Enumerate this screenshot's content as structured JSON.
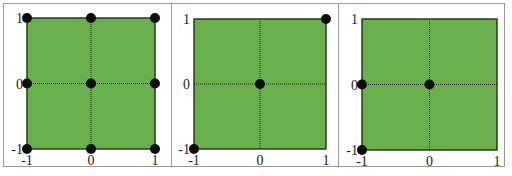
{
  "figure": {
    "background": "#ffffff",
    "plot_fill": "#6ab04c",
    "plot_border": "#2b3a22",
    "grid_line": "#1f2a18",
    "point_color": "#0d0d0d",
    "panel_border": "#9a9a9a"
  },
  "chart_data": [
    {
      "type": "scatter",
      "title": "",
      "xlabel": "",
      "ylabel": "",
      "xlim": [
        -1,
        1
      ],
      "ylim": [
        -1,
        1
      ],
      "xticks": [
        "-1",
        "0",
        "1"
      ],
      "yticks": [
        "-1",
        "0",
        "1"
      ],
      "grid": "dotted lines at x=0 and y=0",
      "points": [
        [
          -1,
          1
        ],
        [
          0,
          1
        ],
        [
          1,
          1
        ],
        [
          -1,
          0
        ],
        [
          0,
          0
        ],
        [
          1,
          0
        ],
        [
          -1,
          -1
        ],
        [
          0,
          -1
        ],
        [
          1,
          -1
        ]
      ]
    },
    {
      "type": "scatter",
      "title": "",
      "xlabel": "",
      "ylabel": "",
      "xlim": [
        -1,
        1
      ],
      "ylim": [
        -1,
        1
      ],
      "xticks": [
        "-1",
        "0",
        "1"
      ],
      "yticks": [
        "-1",
        "0",
        "1"
      ],
      "grid": "dotted lines at x=0 and y=0",
      "points": [
        [
          1,
          1
        ],
        [
          0,
          0
        ],
        [
          -1,
          -1
        ]
      ]
    },
    {
      "type": "scatter",
      "title": "",
      "xlabel": "",
      "ylabel": "",
      "xlim": [
        -1,
        1
      ],
      "ylim": [
        -1,
        1
      ],
      "xticks": [
        "-1",
        "0",
        "1"
      ],
      "yticks": [
        "-1",
        "0",
        "1"
      ],
      "grid": "dotted lines at x=0 and y=0",
      "points": [
        [
          -1,
          0
        ],
        [
          0,
          0
        ],
        [
          -1,
          -1
        ]
      ]
    }
  ],
  "panels": [
    {
      "plot": {
        "left": 27,
        "top": 18,
        "right": 155,
        "bottom": 149
      }
    },
    {
      "plot": {
        "left": 194,
        "top": 19,
        "right": 326,
        "bottom": 149
      }
    },
    {
      "plot": {
        "left": 362,
        "top": 19,
        "right": 497,
        "bottom": 150
      }
    }
  ]
}
